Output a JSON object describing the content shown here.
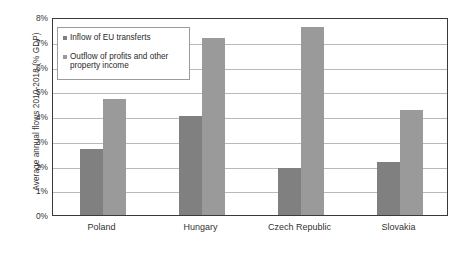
{
  "chart_data": {
    "type": "bar",
    "title": "",
    "xlabel": "",
    "ylabel": "Average annual flows 2010-2018 (% GDP)",
    "categories": [
      "Poland",
      "Hungary",
      "Czech Republic",
      "Slovakia"
    ],
    "series": [
      {
        "name": "Inflow of EU transferts",
        "color": "#808080",
        "values": [
          2.65,
          4.0,
          1.9,
          2.15
        ]
      },
      {
        "name": "Outflow of profits and other property income",
        "color": "#9a9a9a",
        "values": [
          4.7,
          7.15,
          7.6,
          4.25
        ]
      }
    ],
    "ylim": [
      0,
      8
    ],
    "ytick_values": [
      0,
      1,
      2,
      3,
      4,
      5,
      6,
      7,
      8
    ],
    "ytick_labels": [
      "0%",
      "1%",
      "2%",
      "3%",
      "4%",
      "5%",
      "6%",
      "7%",
      "8%"
    ],
    "grid": true,
    "grid_axis": "y",
    "legend_position": "upper-left-inside",
    "legend_entries": [
      "Inflow of EU transferts",
      "Outflow of profits and other property income"
    ]
  },
  "legend": {
    "items": [
      {
        "label": "Inflow of EU transferts",
        "marker": "square-marker-icon"
      },
      {
        "label": "Outflow of profits and other property income",
        "marker": "square-marker-icon"
      }
    ]
  }
}
